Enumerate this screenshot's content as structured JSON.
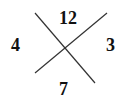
{
  "diagram": {
    "line_color": "#333333",
    "text_color": "#111111",
    "lines": [
      {
        "x1": 35,
        "y1": 13,
        "x2": 95,
        "y2": 83
      },
      {
        "x1": 107,
        "y1": 13,
        "x2": 35,
        "y2": 73
      }
    ],
    "labels": {
      "top": "12",
      "left": "4",
      "right": "3",
      "bottom": "7"
    }
  }
}
